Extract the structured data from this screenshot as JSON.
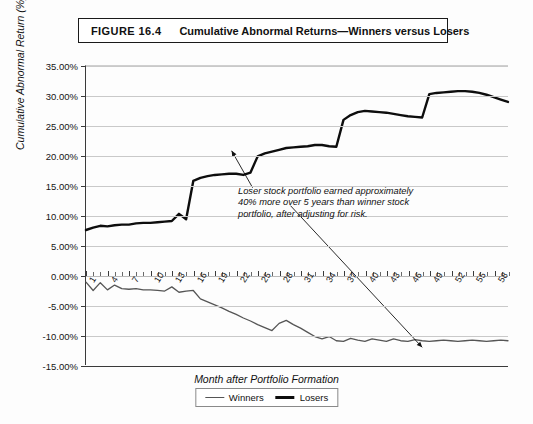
{
  "figure": {
    "number_label": "FIGURE 16.4",
    "caption": "Cumulative Abnormal Returns—Winners versus Losers"
  },
  "annotation": {
    "text": "Loser stock portfolio earned approximately 40% more over 5 years than winner stock portfolio, after adjusting for risk."
  },
  "legend": {
    "winners_label": "Winners",
    "losers_label": "Losers"
  },
  "colors": {
    "winners_line": "#555555",
    "losers_line": "#0d0d0d",
    "grid": "#c9c9c9",
    "axis": "#3a3a3a",
    "background": "#ffffff"
  },
  "chart_data": {
    "type": "line",
    "title": "Cumulative Abnormal Returns—Winners versus Losers",
    "xlabel": "Month after Portfolio Formation",
    "ylabel": "Cumulative Abnormal Return (%)",
    "ylim": [
      -15,
      35
    ],
    "ytick_labels": [
      "35.00%",
      "30.00%",
      "25.00%",
      "20.00%",
      "15.00%",
      "10.00%",
      "5.00%",
      "0.00%",
      "-5.00%",
      "-10.00%",
      "-15.00%"
    ],
    "ytick_values": [
      35,
      30,
      25,
      20,
      15,
      10,
      5,
      0,
      -5,
      -10,
      -15
    ],
    "xlim": [
      1,
      60
    ],
    "xtick_labels": [
      "1",
      "4",
      "7",
      "10",
      "13",
      "16",
      "19",
      "22",
      "25",
      "28",
      "31",
      "34",
      "37",
      "40",
      "43",
      "46",
      "49",
      "52",
      "55",
      "58"
    ],
    "xtick_values": [
      1,
      4,
      7,
      10,
      13,
      16,
      19,
      22,
      25,
      28,
      31,
      34,
      37,
      40,
      43,
      46,
      49,
      52,
      55,
      58
    ],
    "grid": true,
    "legend_position": "bottom-center",
    "x": [
      1,
      2,
      3,
      4,
      5,
      6,
      7,
      8,
      9,
      10,
      11,
      12,
      13,
      14,
      15,
      16,
      17,
      18,
      19,
      20,
      21,
      22,
      23,
      24,
      25,
      26,
      27,
      28,
      29,
      30,
      31,
      32,
      33,
      34,
      35,
      36,
      37,
      38,
      39,
      40,
      41,
      42,
      43,
      44,
      45,
      46,
      47,
      48,
      49,
      50,
      51,
      52,
      53,
      54,
      55,
      56,
      57,
      58,
      59,
      60
    ],
    "series": [
      {
        "name": "Losers",
        "values": [
          7.6,
          8.0,
          8.3,
          8.2,
          8.4,
          8.5,
          8.5,
          8.7,
          8.8,
          8.8,
          8.9,
          9.0,
          9.1,
          10.3,
          9.4,
          15.8,
          16.3,
          16.6,
          16.8,
          16.9,
          17.0,
          17.0,
          16.8,
          17.2,
          19.9,
          20.4,
          20.7,
          21.0,
          21.3,
          21.4,
          21.5,
          21.6,
          21.8,
          21.8,
          21.6,
          21.5,
          26.0,
          26.8,
          27.3,
          27.5,
          27.4,
          27.3,
          27.2,
          27.0,
          26.8,
          26.6,
          26.5,
          26.4,
          30.3,
          30.5,
          30.6,
          30.7,
          30.8,
          30.8,
          30.7,
          30.5,
          30.2,
          29.8,
          29.4,
          29.0
        ]
      },
      {
        "name": "Winners",
        "values": [
          -1.1,
          -2.5,
          -1.2,
          -2.4,
          -1.6,
          -2.2,
          -2.3,
          -2.2,
          -2.4,
          -2.4,
          -2.5,
          -2.6,
          -1.9,
          -2.8,
          -2.6,
          -2.5,
          -3.9,
          -4.4,
          -4.9,
          -5.4,
          -6.0,
          -6.5,
          -7.1,
          -7.6,
          -8.2,
          -8.7,
          -9.2,
          -8.0,
          -7.5,
          -8.2,
          -8.8,
          -9.5,
          -10.2,
          -10.6,
          -10.2,
          -10.9,
          -11.0,
          -10.5,
          -10.8,
          -11.0,
          -10.6,
          -10.8,
          -11.0,
          -10.6,
          -10.9,
          -11.0,
          -10.7,
          -10.9,
          -11.0,
          -10.9,
          -10.8,
          -10.9,
          -11.0,
          -10.9,
          -10.8,
          -10.9,
          -11.0,
          -10.9,
          -10.8,
          -10.9
        ]
      }
    ],
    "annotations": [
      {
        "text": "Loser stock portfolio earned approximately 40% more over 5 years than winner stock portfolio, after adjusting for risk.",
        "arrow_targets": [
          "losers-line",
          "winners-line"
        ]
      }
    ]
  }
}
